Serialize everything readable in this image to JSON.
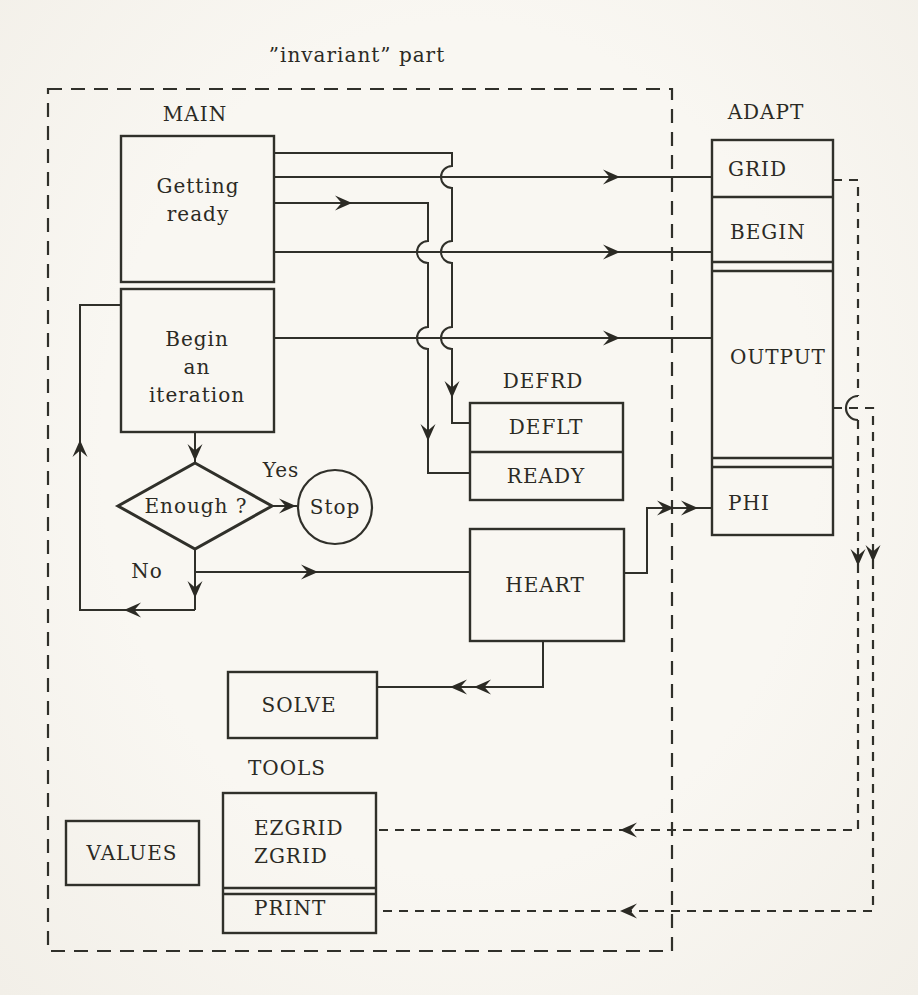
{
  "colors": {
    "paper": "#f8f6f1",
    "ink": "#30302a"
  },
  "title": "”invariant” part",
  "main": {
    "label": "MAIN",
    "getting_ready": "Getting\nready",
    "begin_iteration": "Begin\nan\niteration"
  },
  "decision": {
    "question": "Enough ?",
    "yes_label": "Yes",
    "no_label": "No",
    "stop_label": "Stop"
  },
  "defrd": {
    "label": "DEFRD",
    "deflt": "DEFLT",
    "ready": "READY"
  },
  "heart": {
    "label": "HEART"
  },
  "solve": {
    "label": "SOLVE"
  },
  "tools": {
    "label": "TOOLS",
    "ezgrid": "EZGRID\nZGRID",
    "print": "PRINT"
  },
  "values": {
    "label": "VALUES"
  },
  "adapt": {
    "label": "ADAPT",
    "grid": "GRID",
    "begin": "BEGIN",
    "output": "OUTPUT",
    "phi": "PHI"
  }
}
